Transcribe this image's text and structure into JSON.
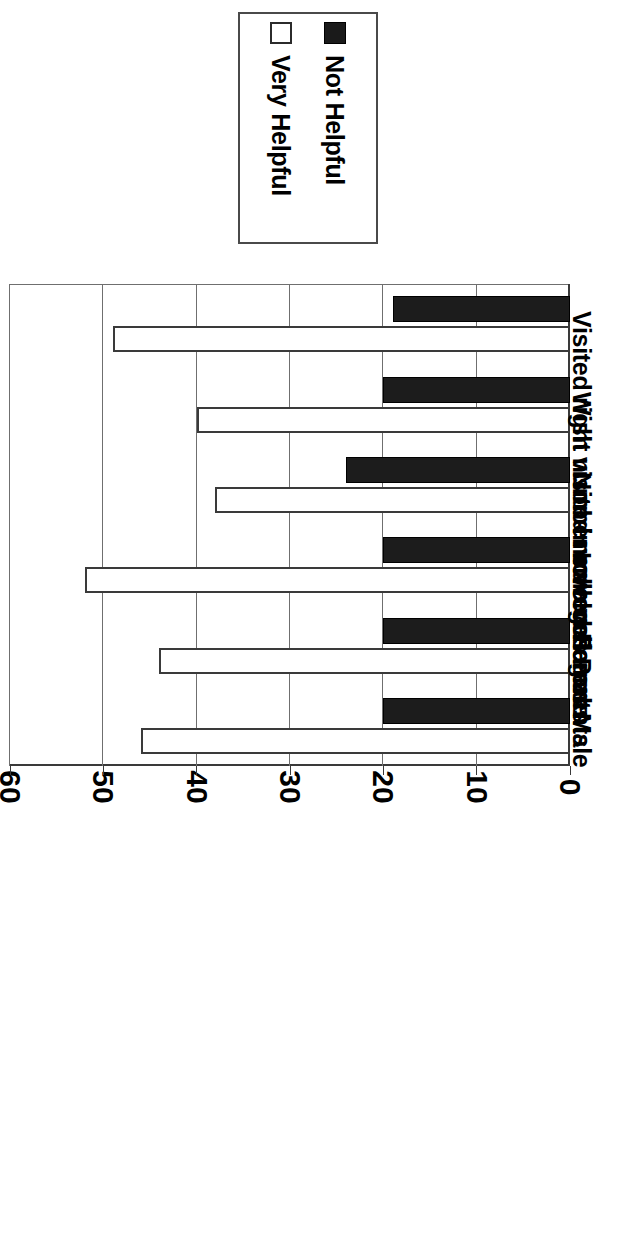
{
  "legend": {
    "position": "top",
    "entries": [
      {
        "label": "Not Helpful",
        "swatch": "filled-square-icon",
        "color": "#1c1c1c"
      },
      {
        "label": "Very Helpful",
        "swatch": "open-square-icon",
        "color": "#ffffff"
      }
    ]
  },
  "axis": {
    "value_ticks": [
      "0",
      "10",
      "20",
      "30",
      "40",
      "50",
      "60"
    ]
  },
  "chart_data": {
    "type": "bar",
    "orientation": "rotated-vertical",
    "title": "",
    "subtitle": "",
    "xlabel": "",
    "ylabel": "",
    "ylim": [
      0,
      60
    ],
    "ytick_step": 10,
    "grid": true,
    "legend_position": "top",
    "categories": [
      "Visited right number colleges",
      "Wish visited more colleges",
      "Non-involved Parents",
      "Involved Parents",
      "Female",
      "Male"
    ],
    "series": [
      {
        "name": "Not Helpful",
        "color": "#1c1c1c",
        "values": [
          19,
          20,
          24,
          20,
          20,
          20
        ]
      },
      {
        "name": "Very Helpful",
        "color": "#ffffff",
        "values": [
          49,
          40,
          38,
          52,
          44,
          46
        ]
      }
    ]
  }
}
